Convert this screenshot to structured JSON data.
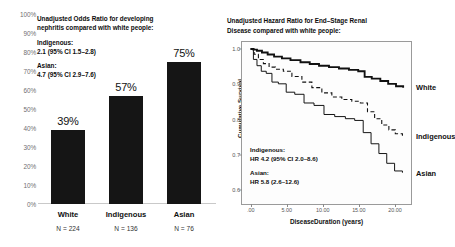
{
  "left": {
    "annotation": {
      "heading_line1": "Unadjusted Odds  Ratio for developing",
      "heading_line2": "nephritis compared with white people:",
      "group1_label": "Indigenous:",
      "group1_value": "2.1 (95% CI 1.5–2.8)",
      "group2_label": "Asian:",
      "group2_value": "4.7 (95% CI 2.9–7.6)"
    },
    "yticks": [
      "100%",
      "90%",
      "80%",
      "70%",
      "60%",
      "50%",
      "40%",
      "30%",
      "20%",
      "10%",
      "0%"
    ]
  },
  "right": {
    "title_line1": "Unadjusted Hazard  Ratio for End–Stage Renal",
    "title_line2": "Disease compared with white people:",
    "ylabel": "Cumulative Survival",
    "xlabel": "DiseaseDuration (years)",
    "series_labels": [
      "White",
      "Indigenous",
      "Asian"
    ],
    "annotation": {
      "group1_label": "Indigenous:",
      "group1_value": "HR 4.2  (95% CI 2.0–8.6)",
      "group2_label": "Asian:",
      "group2_value": "HR 5.8  (2.6–12.6)"
    }
  },
  "chart_data": [
    {
      "type": "bar",
      "title": "Unadjusted Odds  Ratio for developing nephritis compared with white people:",
      "categories": [
        "White",
        "Indigenous",
        "Asian"
      ],
      "values": [
        39,
        57,
        75
      ],
      "value_labels": [
        "39%",
        "57%",
        "75%"
      ],
      "group_ns": [
        "N = 224",
        "N = 136",
        "N = 76"
      ],
      "xlabel": "",
      "ylabel": "",
      "ylim": [
        0,
        100
      ],
      "ytick_values": [
        0,
        10,
        20,
        30,
        40,
        50,
        60,
        70,
        80,
        90,
        100
      ],
      "ytick_labels": [
        "0%",
        "10%",
        "20%",
        "30%",
        "40%",
        "50%",
        "60%",
        "70%",
        "80%",
        "90%",
        "100%"
      ],
      "grid": false,
      "legend": "none",
      "bar_color": "#151515"
    },
    {
      "type": "line",
      "title": "Unadjusted Hazard  Ratio for End–Stage Renal Disease compared with white people:",
      "xlabel": "DiseaseDuration (years)",
      "ylabel": "Cumulative Survival",
      "xlim": [
        -1.2,
        22.5
      ],
      "ylim": [
        0.555,
        1.02
      ],
      "xtick_values": [
        0,
        5,
        10,
        15,
        20
      ],
      "xtick_labels": [
        ".00",
        "5.00",
        "10.00",
        "15.00",
        "20.00"
      ],
      "ytick_values": [
        0.6,
        0.7,
        0.8,
        0.9,
        1.0
      ],
      "ytick_labels": [
        "0.6",
        "0.7",
        "0.8",
        "0.9",
        "1.0"
      ],
      "grid": false,
      "legend": "right-of-axes",
      "series": [
        {
          "name": "White",
          "style": "solid-thick",
          "x": [
            0,
            0.4,
            0.9,
            1.6,
            2.4,
            3.3,
            4.4,
            5.6,
            7.0,
            8.3,
            9.6,
            11.0,
            12.4,
            13.8,
            15.1,
            16.0,
            17.0,
            18.2,
            19.3,
            20.4,
            21.4
          ],
          "y": [
            1.0,
            0.998,
            0.995,
            0.99,
            0.984,
            0.978,
            0.973,
            0.968,
            0.962,
            0.957,
            0.952,
            0.948,
            0.944,
            0.94,
            0.936,
            0.92,
            0.915,
            0.908,
            0.9,
            0.893,
            0.889
          ]
        },
        {
          "name": "Indigenous",
          "style": "dashed",
          "x": [
            0,
            0.5,
            1.1,
            1.8,
            2.6,
            3.5,
            4.6,
            5.8,
            7.2,
            8.6,
            10.0,
            11.4,
            12.8,
            14.2,
            15.4,
            16.4,
            17.4,
            18.4,
            19.4,
            20.3,
            21.3
          ],
          "y": [
            1.0,
            0.985,
            0.97,
            0.958,
            0.948,
            0.942,
            0.936,
            0.921,
            0.905,
            0.889,
            0.874,
            0.862,
            0.855,
            0.85,
            0.845,
            0.82,
            0.8,
            0.782,
            0.768,
            0.757,
            0.75
          ]
        },
        {
          "name": "Asian",
          "style": "solid-thin",
          "x": [
            0,
            0.4,
            0.9,
            1.5,
            2.2,
            3.0,
            3.9,
            5.0,
            6.2,
            7.5,
            8.9,
            10.3,
            11.8,
            13.3,
            14.6,
            15.8,
            16.9,
            18.0,
            19.1,
            20.2,
            21.3
          ],
          "y": [
            1.0,
            0.97,
            0.952,
            0.936,
            0.93,
            0.905,
            0.9,
            0.876,
            0.87,
            0.845,
            0.838,
            0.812,
            0.806,
            0.8,
            0.795,
            0.76,
            0.728,
            0.7,
            0.672,
            0.65,
            0.645
          ]
        }
      ]
    }
  ]
}
